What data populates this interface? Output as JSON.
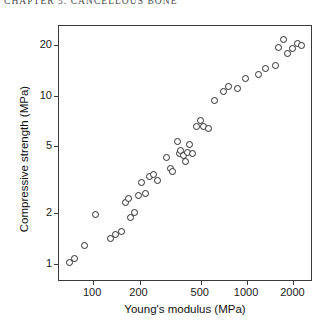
{
  "page": {
    "running_header": "CHAPTER 5. CANCELLOUS BONE"
  },
  "chart_data": {
    "type": "scatter",
    "title": "",
    "xlabel": "Young's modulus (MPa)",
    "ylabel": "Compressive strength (MPa)",
    "xscale": "log",
    "yscale": "log",
    "xlim": [
      60,
      2600
    ],
    "ylim": [
      0.8,
      26
    ],
    "grid": false,
    "legend": null,
    "marker": "open-circle",
    "xticks": [
      100,
      200,
      500,
      1000,
      2000
    ],
    "xtick_labels": [
      "100",
      "200",
      "500",
      "1000",
      "2000"
    ],
    "yticks": [
      1,
      2,
      5,
      10,
      20
    ],
    "ytick_labels": [
      "1",
      "2",
      "5",
      "10",
      "20"
    ],
    "series": [
      {
        "name": "cancellous bone specimens",
        "points": [
          [
            70,
            1.02
          ],
          [
            76,
            1.07
          ],
          [
            88,
            1.28
          ],
          [
            104,
            1.95
          ],
          [
            130,
            1.42
          ],
          [
            140,
            1.5
          ],
          [
            152,
            1.55
          ],
          [
            163,
            2.3
          ],
          [
            170,
            2.45
          ],
          [
            176,
            1.88
          ],
          [
            186,
            2.02
          ],
          [
            196,
            2.55
          ],
          [
            205,
            3.05
          ],
          [
            218,
            2.62
          ],
          [
            232,
            3.3
          ],
          [
            246,
            3.42
          ],
          [
            262,
            3.12
          ],
          [
            300,
            4.3
          ],
          [
            318,
            3.68
          ],
          [
            330,
            3.55
          ],
          [
            352,
            5.35
          ],
          [
            366,
            4.55
          ],
          [
            372,
            4.7
          ],
          [
            386,
            4.38
          ],
          [
            398,
            4.05
          ],
          [
            408,
            4.62
          ],
          [
            424,
            5.1
          ],
          [
            442,
            4.52
          ],
          [
            470,
            6.6
          ],
          [
            500,
            7.1
          ],
          [
            520,
            6.55
          ],
          [
            560,
            6.35
          ],
          [
            610,
            9.4
          ],
          [
            700,
            10.6
          ],
          [
            760,
            11.4
          ],
          [
            860,
            11.0
          ],
          [
            980,
            12.6
          ],
          [
            1180,
            13.4
          ],
          [
            1320,
            14.6
          ],
          [
            1520,
            15.2
          ],
          [
            1600,
            19.4
          ],
          [
            1720,
            21.6
          ],
          [
            1840,
            17.8
          ],
          [
            1960,
            19.0
          ],
          [
            2120,
            20.4
          ],
          [
            2260,
            19.8
          ]
        ]
      }
    ]
  }
}
